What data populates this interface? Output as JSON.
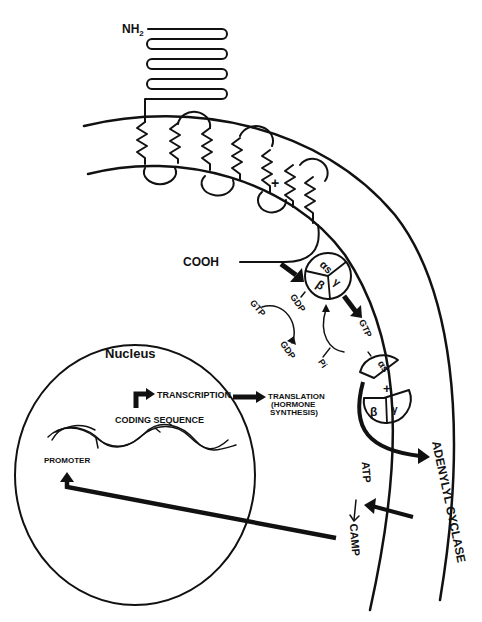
{
  "diagram": {
    "type": "cell-signaling-pathway",
    "receptor": {
      "n_terminus_label": "NH",
      "n_terminus_subscript": "2",
      "c_terminus_label": "COOH",
      "transmembrane_domains": 7,
      "marker": "+"
    },
    "g_protein": {
      "alpha_label": "αs",
      "beta_label": "β",
      "gamma_label": "γ",
      "bound_nucleotide_label": "GDP",
      "exchange_in_label": "GTP",
      "exchange_out_label": "GDP",
      "activated_label": "GTP",
      "phosphate_label": "Pi",
      "dissociation_marker": "+"
    },
    "effector": {
      "enzyme_label": "ADENYLYL CYCLASE",
      "substrate_label": "ATP",
      "product_label": "CAMP"
    },
    "nucleus": {
      "title": "Nucleus",
      "promoter_label": "PROMOTER",
      "coding_sequence_label": "CODING SEQUENCE",
      "transcription_label": "TRANSCRIPTION",
      "translation_label_line1": "TRANSLATION",
      "translation_label_line2": "(HORMONE",
      "translation_label_line3": "SYNTHESIS)"
    },
    "colors": {
      "ink": "#111111",
      "background": "#ffffff"
    }
  }
}
